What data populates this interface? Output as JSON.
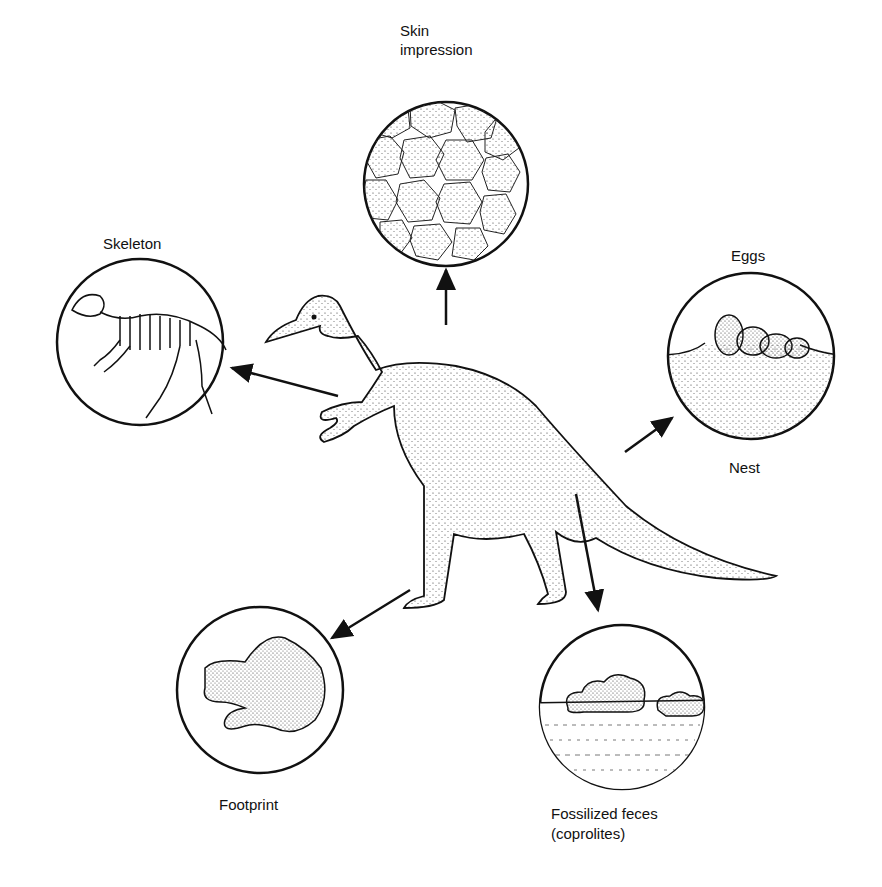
{
  "diagram": {
    "center": "dinosaur-illustration",
    "nodes": [
      {
        "id": "skin",
        "label_line1": "Skin",
        "label_line2": "impression"
      },
      {
        "id": "skeleton",
        "label": "Skeleton"
      },
      {
        "id": "eggs",
        "label_top": "Eggs",
        "label_bottom": "Nest"
      },
      {
        "id": "footprint",
        "label": "Footprint"
      },
      {
        "id": "feces",
        "label_line1": "Fossilized feces",
        "label_line2": "(coprolites)"
      }
    ],
    "colors": {
      "ink": "#111111",
      "background": "#ffffff"
    }
  }
}
